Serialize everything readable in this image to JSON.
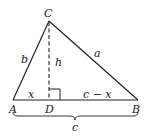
{
  "diagram": {
    "type": "triangle-with-altitude",
    "vertices": {
      "A": {
        "label": "A"
      },
      "B": {
        "label": "B"
      },
      "C": {
        "label": "C"
      },
      "D": {
        "label": "D"
      }
    },
    "sides": {
      "b": "b",
      "a": "a",
      "h": "h",
      "x": "x",
      "c_minus_x": "c − x",
      "c": "c"
    },
    "line_color": "#222222"
  }
}
